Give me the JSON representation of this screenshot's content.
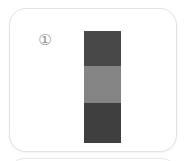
{
  "canvas": {
    "width": 188,
    "height": 161,
    "background": "#ffffff"
  },
  "card": {
    "label": "",
    "background": "#ffffff",
    "border_color": "#e3e3e3",
    "corner_radius": 17
  },
  "card_next": {
    "label": "",
    "background": "#ffffff",
    "border_color": "#e8e8e8"
  },
  "index_marker": {
    "symbol": "①",
    "value": 1,
    "color": "#8d8d8d"
  },
  "figure": {
    "name": "tri-band-vertical-bar",
    "orientation": "vertical",
    "x": 74,
    "y": 22,
    "width": 37,
    "height": 112,
    "bands": [
      {
        "label": "",
        "position": "top",
        "color": "#484848",
        "tone": "dark",
        "height_px": 35
      },
      {
        "label": "",
        "position": "middle",
        "color": "#848484",
        "tone": "light",
        "height_px": 37
      },
      {
        "label": "",
        "position": "bottom",
        "color": "#3f3f3f",
        "tone": "dark",
        "height_px": 40
      }
    ]
  }
}
